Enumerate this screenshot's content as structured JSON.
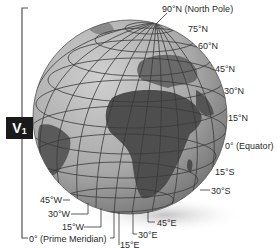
{
  "figure": {
    "badge": {
      "letter": "V",
      "subscript": "1"
    },
    "latitude_labels": [
      {
        "id": "lat-90n",
        "text": "90°N (North Pole)",
        "x": 162,
        "y": 4
      },
      {
        "id": "lat-75n",
        "text": "75°N",
        "x": 188,
        "y": 24
      },
      {
        "id": "lat-60n",
        "text": "60°N",
        "x": 198,
        "y": 41
      },
      {
        "id": "lat-45n",
        "text": "45°N",
        "x": 215,
        "y": 64
      },
      {
        "id": "lat-30n",
        "text": "30°N",
        "x": 224,
        "y": 86
      },
      {
        "id": "lat-15n",
        "text": "15°N",
        "x": 228,
        "y": 113
      },
      {
        "id": "lat-0",
        "text": "0° (Equator)",
        "x": 225,
        "y": 141
      },
      {
        "id": "lat-15s",
        "text": "15°S",
        "x": 215,
        "y": 167
      },
      {
        "id": "lat-30s",
        "text": "30°S",
        "x": 211,
        "y": 186
      }
    ],
    "longitude_labels": [
      {
        "id": "lon-45w",
        "text": "45°W",
        "x": 40,
        "y": 195
      },
      {
        "id": "lon-30w",
        "text": "30°W",
        "x": 48,
        "y": 209
      },
      {
        "id": "lon-15w",
        "text": "15°W",
        "x": 62,
        "y": 222
      },
      {
        "id": "lon-0",
        "text": "0° (Prime Meridian)",
        "x": 29,
        "y": 234
      },
      {
        "id": "lon-45e",
        "text": "45°E",
        "x": 157,
        "y": 218
      },
      {
        "id": "lon-30e",
        "text": "30°E",
        "x": 138,
        "y": 230
      },
      {
        "id": "lon-15e",
        "text": "15°E",
        "x": 120,
        "y": 240
      }
    ],
    "colors": {
      "ocean": "#a8a8a8",
      "land": "#5a5a5a",
      "grid": "#3a3a3a",
      "shadow": "#cfcfcf"
    }
  }
}
